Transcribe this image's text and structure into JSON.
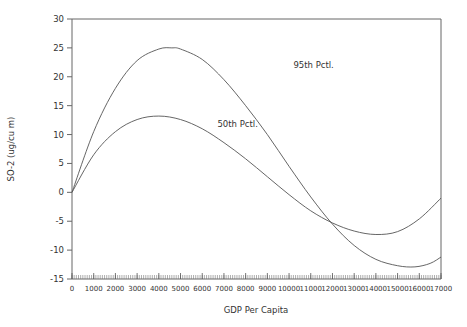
{
  "chart_data": {
    "type": "line",
    "title": "",
    "xlabel": "GDP Per Capita",
    "ylabel": "SO-2  (ug/cu m)",
    "xlim": [
      0,
      17000
    ],
    "ylim": [
      -15,
      30
    ],
    "xticks": [
      0,
      1000,
      2000,
      3000,
      4000,
      5000,
      6000,
      7000,
      8000,
      9000,
      10000,
      11000,
      12000,
      13000,
      14000,
      15000,
      16000,
      17000
    ],
    "xtick_labels": [
      "0",
      "1000",
      "2000",
      "3000",
      "4000",
      "5000",
      "6000",
      "7000",
      "8000",
      "9000",
      "10000",
      "11000",
      "12000",
      "13000",
      "14000",
      "15000",
      "16000",
      "17000"
    ],
    "yticks": [
      -15,
      -10,
      -5,
      0,
      5,
      10,
      15,
      20,
      25,
      30
    ],
    "ytick_labels": [
      "-15",
      "-10",
      "-5",
      "0",
      "5",
      "10",
      "15",
      "20",
      "25",
      "30"
    ],
    "grid": false,
    "legend": "none",
    "series": [
      {
        "name": "95th Pctl.",
        "x": [
          0,
          1000,
          2000,
          3000,
          4000,
          4600,
          5000,
          6000,
          7000,
          8000,
          9000,
          10000,
          11000,
          12000,
          13000,
          14000,
          15000,
          15800,
          16500,
          17000
        ],
        "values": [
          0,
          10.5,
          18,
          22.8,
          24.8,
          25,
          24.8,
          23,
          19.5,
          15,
          10,
          4.5,
          -0.8,
          -5.5,
          -9.2,
          -11.6,
          -12.7,
          -12.9,
          -12.3,
          -11.2
        ]
      },
      {
        "name": "50th Pctl.",
        "x": [
          0,
          1000,
          2000,
          3000,
          4000,
          5000,
          6000,
          7000,
          8000,
          9000,
          10000,
          11000,
          12000,
          13000,
          14000,
          15000,
          16000,
          17000
        ],
        "values": [
          0,
          6.5,
          10.5,
          12.6,
          13.2,
          12.6,
          11,
          8.6,
          5.8,
          2.7,
          -0.4,
          -3.2,
          -5.3,
          -6.7,
          -7.3,
          -6.8,
          -4.6,
          -1.0
        ]
      }
    ],
    "annotations": [
      {
        "text": "95th Pctl.",
        "x": 10200,
        "y": 21.5
      },
      {
        "text": "50th Pctl.",
        "x": 6700,
        "y": 11.3
      }
    ]
  }
}
